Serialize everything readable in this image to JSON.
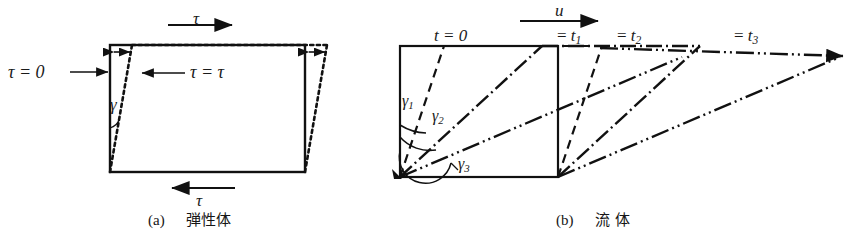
{
  "figure": {
    "background": "#ffffff",
    "ink": "#111111"
  },
  "panel_a": {
    "caption_index": "(a)",
    "caption_text": "弾性体",
    "labels": {
      "shear_top": "τ",
      "shear_bottom": "τ",
      "shear_zero": "τ = 0",
      "shear_equal": "τ = τ",
      "angle": "γ"
    },
    "geometry": {
      "rect": {
        "x": 110,
        "y": 45,
        "w": 195,
        "h": 127
      },
      "shear_offset_px": 22
    }
  },
  "panel_b": {
    "caption_index": "(b)",
    "caption_text": "流  体",
    "labels": {
      "velocity": "u",
      "t0": "t = 0",
      "t1_eq": "=",
      "t1_var": "t",
      "t1_sub": "1",
      "t2_eq": "=",
      "t2_var": "t",
      "t2_sub": "2",
      "t3_eq": "=",
      "t3_var": "t",
      "t3_sub": "3",
      "gamma1_var": "γ",
      "gamma1_sub": "1",
      "gamma2_var": "γ",
      "gamma2_sub": "2",
      "gamma3_var": "γ",
      "gamma3_sub": "3"
    },
    "geometry": {
      "rect": {
        "x": 400,
        "y": 46,
        "w": 158,
        "h": 131
      },
      "t1_top_x": 592,
      "t2_top_x": 700,
      "t3_top_x": 840
    }
  }
}
